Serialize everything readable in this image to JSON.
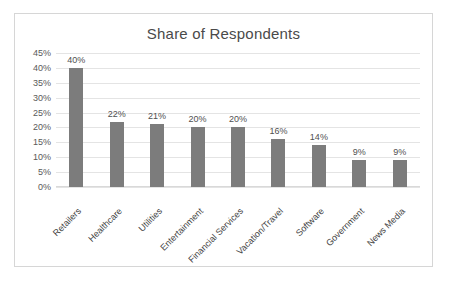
{
  "chart_data": {
    "type": "bar",
    "title": "Share of Respondents",
    "xlabel": "",
    "ylabel": "",
    "ylim": [
      0,
      45
    ],
    "grid": true,
    "legend": false,
    "value_suffix": "%",
    "categories": [
      "Retailers",
      "Healthcare",
      "Utilities",
      "Entertainment",
      "Financial Services",
      "Vacation/Travel",
      "Software",
      "Government",
      "News Media"
    ],
    "values": [
      40,
      22,
      21,
      20,
      20,
      16,
      14,
      9,
      9
    ],
    "data_labels": [
      "40%",
      "22%",
      "21%",
      "20%",
      "20%",
      "16%",
      "14%",
      "9%",
      "9%"
    ],
    "y_ticks": [
      0,
      5,
      10,
      15,
      20,
      25,
      30,
      35,
      40,
      45
    ],
    "y_tick_labels": [
      "0%",
      "5%",
      "10%",
      "15%",
      "20%",
      "25%",
      "30%",
      "35%",
      "40%",
      "45%"
    ],
    "colors": {
      "bar": "#7c7c7c",
      "gridline": "#e4e4e4",
      "title_text": "#4a4a4a",
      "tick_text": "#595959",
      "label_text": "#4f4f4f",
      "frame_border": "#d6d6d6",
      "background": "#ffffff"
    }
  }
}
